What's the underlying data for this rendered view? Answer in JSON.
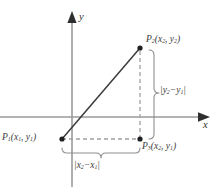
{
  "figure": {
    "name": "distance-formula-right-triangle",
    "background_color": "#ffffff",
    "axis_color": "#9a9a9a",
    "line_color": "#3b3b3b",
    "dashed_color": "#a0a0a0",
    "brace_color": "#8f8f8f",
    "text_color": "#3a3a3a"
  },
  "axes": {
    "x_label": "x",
    "y_label": "y",
    "origin": {
      "x": 72,
      "y": 117
    }
  },
  "points": [
    {
      "id": "P1",
      "label_name": "P",
      "label_sub": "1",
      "coord_x": "x",
      "coord_x_sub": "1",
      "coord_y": "y",
      "coord_y_sub": "1",
      "px": 62,
      "py": 139
    },
    {
      "id": "P2",
      "label_name": "P",
      "label_sub": "2",
      "coord_x": "x",
      "coord_x_sub": "2",
      "coord_y": "y",
      "coord_y_sub": "2",
      "px": 140,
      "py": 48
    },
    {
      "id": "P3",
      "label_name": "P",
      "label_sub": "3",
      "coord_x": "x",
      "coord_x_sub": "2",
      "coord_y": "y",
      "coord_y_sub": "1",
      "px": 140,
      "py": 139
    }
  ],
  "segments": {
    "hypotenuse": {
      "from": "P1",
      "to": "P2",
      "style": "solid"
    },
    "horizontal_leg": {
      "from": "P1",
      "to": "P3",
      "style": "dashed"
    },
    "vertical_leg": {
      "from": "P3",
      "to": "P2",
      "style": "dashed"
    }
  },
  "measures": {
    "vertical": {
      "var": "y",
      "sub_a": "2",
      "sub_b": "1",
      "operator": "−",
      "open_bar": "|",
      "close_bar": "|"
    },
    "horizontal": {
      "var": "x",
      "sub_a": "2",
      "sub_b": "1",
      "operator": "−",
      "open_bar": "|",
      "close_bar": "|"
    }
  },
  "punctuation": {
    "open_paren": "(",
    "close_paren": ")",
    "comma": ", "
  }
}
